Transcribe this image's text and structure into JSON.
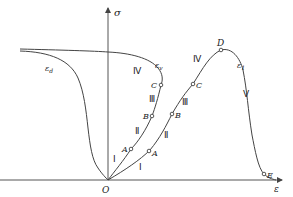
{
  "diagram": {
    "type": "stress-strain curve",
    "axes": {
      "y_label": "σ",
      "x_label": "ε",
      "origin_label": "O"
    },
    "curves": [
      {
        "id": "axial",
        "label": "ε",
        "label_sub": "1"
      },
      {
        "id": "volumetric",
        "label": "ε",
        "label_sub": "v"
      },
      {
        "id": "lateral",
        "label": "ε",
        "label_sub": "d"
      }
    ],
    "points": {
      "axial": [
        "A",
        "B",
        "C",
        "D",
        "E"
      ],
      "volumetric": [
        "A",
        "B",
        "C"
      ]
    },
    "stages": {
      "axial": [
        "Ⅰ",
        "Ⅱ",
        "Ⅲ",
        "Ⅳ",
        "Ⅴ"
      ],
      "volumetric": [
        "Ⅰ",
        "Ⅱ",
        "Ⅲ",
        "Ⅳ"
      ]
    },
    "colors": {
      "line": "#444444",
      "text": "#222222",
      "background": "#ffffff"
    }
  }
}
